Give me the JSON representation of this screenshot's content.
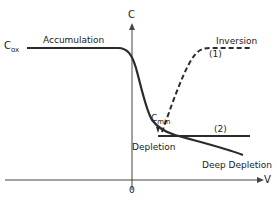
{
  "diagram": {
    "axes": {
      "y_label": "C",
      "x_label": "V",
      "origin_label": "0"
    },
    "level_label": {
      "main": "C",
      "sub": "ox"
    },
    "cmin_label": {
      "main": "C",
      "sub": "min"
    },
    "regions": {
      "accumulation": "Accumulation",
      "inversion": "Inversion",
      "depletion": "Depletion",
      "deep_depletion": "Deep Depletion"
    },
    "curve_labels": {
      "curve1": "(1)",
      "curve2": "(2)"
    },
    "colors": {
      "line": "#2b2b2b",
      "text": "#222222"
    }
  }
}
